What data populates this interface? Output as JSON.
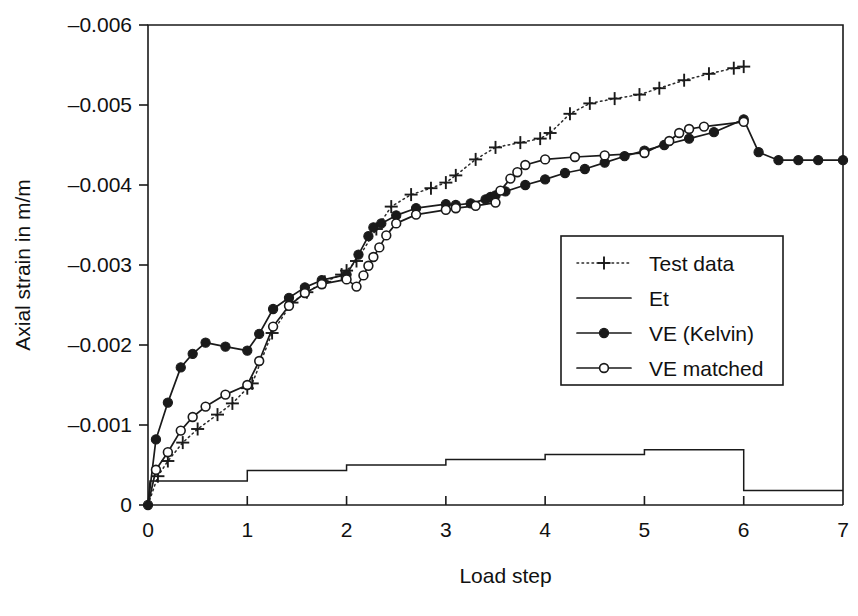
{
  "chart_data": {
    "type": "line",
    "title": "",
    "xlabel": "Load step",
    "ylabel": "Axial strain in m/m",
    "xlim": [
      0,
      7
    ],
    "ylim": [
      0,
      -0.006
    ],
    "xticks": [
      0,
      1,
      2,
      3,
      4,
      5,
      6,
      7
    ],
    "xtick_labels": [
      "0",
      "1",
      "2",
      "3",
      "4",
      "5",
      "6",
      "7"
    ],
    "yticks": [
      0,
      -0.001,
      -0.002,
      -0.003,
      -0.004,
      -0.005,
      -0.006
    ],
    "ytick_labels": [
      "0",
      "–0.001",
      "–0.002",
      "–0.003",
      "–0.004",
      "–0.005",
      "–0.006"
    ],
    "grid": false,
    "legend_position": "center-right",
    "y_axis_direction": "inverted-negative-up",
    "series": [
      {
        "name": "Test data",
        "marker": "plus",
        "line_style": "dotted",
        "points": [
          [
            0.0,
            0.0
          ],
          [
            0.1,
            -0.00036
          ],
          [
            0.2,
            -0.00055
          ],
          [
            0.35,
            -0.00078
          ],
          [
            0.5,
            -0.00095
          ],
          [
            0.7,
            -0.00113
          ],
          [
            0.85,
            -0.00127
          ],
          [
            1.0,
            -0.00146
          ],
          [
            1.05,
            -0.00152
          ],
          [
            1.25,
            -0.00215
          ],
          [
            1.45,
            -0.00253
          ],
          [
            1.6,
            -0.00266
          ],
          [
            1.78,
            -0.00279
          ],
          [
            1.95,
            -0.00288
          ],
          [
            2.0,
            -0.00293
          ],
          [
            2.1,
            -0.00305
          ],
          [
            2.3,
            -0.00345
          ],
          [
            2.45,
            -0.00373
          ],
          [
            2.65,
            -0.00388
          ],
          [
            2.85,
            -0.00396
          ],
          [
            3.0,
            -0.00403
          ],
          [
            3.1,
            -0.00412
          ],
          [
            3.3,
            -0.00432
          ],
          [
            3.5,
            -0.00447
          ],
          [
            3.75,
            -0.00453
          ],
          [
            3.95,
            -0.00458
          ],
          [
            4.05,
            -0.00465
          ],
          [
            4.25,
            -0.00489
          ],
          [
            4.45,
            -0.00502
          ],
          [
            4.7,
            -0.00508
          ],
          [
            4.95,
            -0.00513
          ],
          [
            5.15,
            -0.00521
          ],
          [
            5.4,
            -0.00531
          ],
          [
            5.65,
            -0.00539
          ],
          [
            5.9,
            -0.00546
          ],
          [
            6.0,
            -0.00548
          ]
        ]
      },
      {
        "name": "Et",
        "marker": "none",
        "line_style": "step",
        "points": [
          [
            0.0,
            0.0
          ],
          [
            0.02,
            -0.0003
          ],
          [
            1.0,
            -0.0003
          ],
          [
            1.0,
            -0.00043
          ],
          [
            2.0,
            -0.00043
          ],
          [
            2.0,
            -0.0005
          ],
          [
            3.0,
            -0.0005
          ],
          [
            3.0,
            -0.00057
          ],
          [
            4.0,
            -0.00057
          ],
          [
            4.0,
            -0.00063
          ],
          [
            5.0,
            -0.00063
          ],
          [
            5.0,
            -0.00069
          ],
          [
            6.0,
            -0.00069
          ],
          [
            6.0,
            -0.00018
          ],
          [
            7.0,
            -0.00018
          ]
        ]
      },
      {
        "name": "VE (Kelvin)",
        "marker": "filled-circle",
        "line_style": "solid",
        "points": [
          [
            0.0,
            0.0
          ],
          [
            0.08,
            -0.00082
          ],
          [
            0.2,
            -0.00128
          ],
          [
            0.33,
            -0.00172
          ],
          [
            0.45,
            -0.00189
          ],
          [
            0.58,
            -0.00203
          ],
          [
            0.78,
            -0.00198
          ],
          [
            1.0,
            -0.00193
          ],
          [
            1.12,
            -0.00214
          ],
          [
            1.26,
            -0.00245
          ],
          [
            1.42,
            -0.00259
          ],
          [
            1.58,
            -0.00272
          ],
          [
            1.75,
            -0.00281
          ],
          [
            2.0,
            -0.00288
          ],
          [
            2.12,
            -0.00313
          ],
          [
            2.22,
            -0.00336
          ],
          [
            2.27,
            -0.00347
          ],
          [
            2.35,
            -0.00352
          ],
          [
            2.5,
            -0.00362
          ],
          [
            2.7,
            -0.00371
          ],
          [
            3.0,
            -0.00376
          ],
          [
            3.1,
            -0.00375
          ],
          [
            3.25,
            -0.00377
          ],
          [
            3.4,
            -0.00382
          ],
          [
            3.45,
            -0.00385
          ],
          [
            3.5,
            -0.00387
          ],
          [
            3.6,
            -0.00392
          ],
          [
            3.8,
            -0.004
          ],
          [
            4.0,
            -0.00407
          ],
          [
            4.2,
            -0.00415
          ],
          [
            4.4,
            -0.0042
          ],
          [
            4.6,
            -0.00428
          ],
          [
            4.8,
            -0.00436
          ],
          [
            5.0,
            -0.00443
          ],
          [
            5.2,
            -0.0045
          ],
          [
            5.45,
            -0.00458
          ],
          [
            5.7,
            -0.00466
          ],
          [
            6.0,
            -0.00482
          ],
          [
            6.15,
            -0.00441
          ],
          [
            6.35,
            -0.00431
          ],
          [
            6.55,
            -0.00431
          ],
          [
            6.75,
            -0.00431
          ],
          [
            7.0,
            -0.00431
          ]
        ]
      },
      {
        "name": "VE matched",
        "marker": "open-circle",
        "line_style": "solid",
        "points": [
          [
            0.0,
            0.0
          ],
          [
            0.08,
            -0.00044
          ],
          [
            0.2,
            -0.00066
          ],
          [
            0.33,
            -0.00093
          ],
          [
            0.45,
            -0.0011
          ],
          [
            0.58,
            -0.00123
          ],
          [
            0.78,
            -0.00138
          ],
          [
            1.0,
            -0.0015
          ],
          [
            1.12,
            -0.0018
          ],
          [
            1.26,
            -0.00223
          ],
          [
            1.42,
            -0.00249
          ],
          [
            1.58,
            -0.00265
          ],
          [
            1.75,
            -0.00276
          ],
          [
            2.0,
            -0.00282
          ],
          [
            2.1,
            -0.00273
          ],
          [
            2.17,
            -0.00287
          ],
          [
            2.22,
            -0.00299
          ],
          [
            2.27,
            -0.0031
          ],
          [
            2.33,
            -0.00322
          ],
          [
            2.4,
            -0.00337
          ],
          [
            2.5,
            -0.00352
          ],
          [
            2.7,
            -0.00363
          ],
          [
            3.0,
            -0.00369
          ],
          [
            3.1,
            -0.00371
          ],
          [
            3.3,
            -0.00374
          ],
          [
            3.5,
            -0.00378
          ],
          [
            3.55,
            -0.00393
          ],
          [
            3.65,
            -0.00408
          ],
          [
            3.72,
            -0.00416
          ],
          [
            3.8,
            -0.00425
          ],
          [
            4.0,
            -0.00432
          ],
          [
            4.3,
            -0.00435
          ],
          [
            4.6,
            -0.00437
          ],
          [
            5.0,
            -0.0044
          ],
          [
            5.25,
            -0.00455
          ],
          [
            5.35,
            -0.00465
          ],
          [
            5.45,
            -0.0047
          ],
          [
            5.6,
            -0.00473
          ],
          [
            6.0,
            -0.00479
          ]
        ]
      }
    ]
  },
  "legend": {
    "items": [
      {
        "label": "Test data",
        "style": "dotted-plus"
      },
      {
        "label": "Et",
        "style": "solid-plain"
      },
      {
        "label": "VE (Kelvin)",
        "style": "solid-filled-circle"
      },
      {
        "label": "VE matched",
        "style": "solid-open-circle"
      }
    ]
  }
}
